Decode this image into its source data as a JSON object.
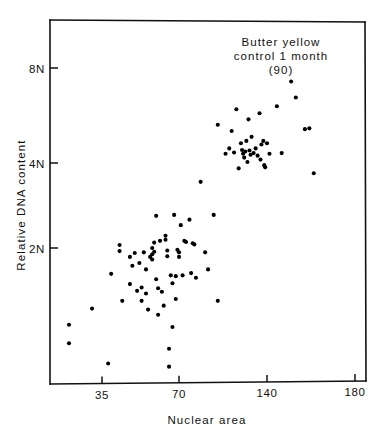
{
  "figure": {
    "background_color": "#ffffff",
    "ink_color": "#111111",
    "marker_color": "#000000"
  },
  "annotation": {
    "line1": "Butter yellow",
    "line2": "control 1 month",
    "line3": "(90)"
  },
  "chart_data": {
    "type": "scatter",
    "title": "Butter yellow control 1 month (90)",
    "xlabel": "Nuclear area",
    "ylabel": "Relative DNA content",
    "grid": false,
    "legend": false,
    "n_points_stated": 90,
    "x_ticks": [
      35,
      70,
      140,
      180
    ],
    "x_tick_labels": [
      "35",
      "70",
      "140",
      "180"
    ],
    "y_ticks": [
      2,
      4,
      8
    ],
    "y_tick_labels": [
      "2N",
      "4N",
      "8N"
    ],
    "x_scale": "log-like (35,70,140 equally spaced doublings)",
    "y_scale": "log2 (2N,4N,8N equally spaced doublings)",
    "xlim": [
      22,
      196
    ],
    "ylim": [
      0.62,
      11.4
    ],
    "series": [
      {
        "name": "nuclei",
        "marker": "filled-circle",
        "points": [
          [
            26,
            1.07
          ],
          [
            26,
            0.92
          ],
          [
            32,
            1.22
          ],
          [
            37,
            0.78
          ],
          [
            38,
            1.62
          ],
          [
            41,
            2.05
          ],
          [
            41,
            1.95
          ],
          [
            42,
            1.3
          ],
          [
            45,
            1.86
          ],
          [
            45,
            1.49
          ],
          [
            46,
            1.73
          ],
          [
            47,
            1.92
          ],
          [
            48,
            1.41
          ],
          [
            49,
            1.77
          ],
          [
            50,
            1.45
          ],
          [
            50,
            1.3
          ],
          [
            51,
            1.93
          ],
          [
            52,
            1.68
          ],
          [
            52,
            1.38
          ],
          [
            53,
            1.21
          ],
          [
            54,
            1.86
          ],
          [
            55,
            2.0
          ],
          [
            55,
            1.9
          ],
          [
            55,
            1.82
          ],
          [
            56,
            2.09
          ],
          [
            56,
            1.94
          ],
          [
            57,
            2.6
          ],
          [
            57,
            1.55
          ],
          [
            58,
            1.44
          ],
          [
            58,
            1.16
          ],
          [
            59,
            2.12
          ],
          [
            60,
            1.4
          ],
          [
            61,
            1.25
          ],
          [
            62,
            2.21
          ],
          [
            62,
            2.14
          ],
          [
            63,
            1.96
          ],
          [
            63,
            1.87
          ],
          [
            64,
            0.88
          ],
          [
            64,
            0.76
          ],
          [
            65,
            1.6
          ],
          [
            66,
            1.5
          ],
          [
            66,
            1.05
          ],
          [
            67,
            2.62
          ],
          [
            68,
            1.59
          ],
          [
            68,
            1.32
          ],
          [
            69,
            1.97
          ],
          [
            70,
            1.93
          ],
          [
            70,
            1.86
          ],
          [
            71,
            2.41
          ],
          [
            72,
            1.6
          ],
          [
            73,
            2.12
          ],
          [
            74,
            2.1
          ],
          [
            76,
            2.52
          ],
          [
            77,
            1.63
          ],
          [
            78,
            2.08
          ],
          [
            79,
            2.06
          ],
          [
            80,
            1.57
          ],
          [
            83,
            3.43
          ],
          [
            86,
            1.93
          ],
          [
            88,
            1.68
          ],
          [
            92,
            2.62
          ],
          [
            95,
            1.3
          ],
          [
            95,
            5.29
          ],
          [
            101,
            4.28
          ],
          [
            104,
            4.45
          ],
          [
            106,
            5.05
          ],
          [
            108,
            4.32
          ],
          [
            110,
            5.92
          ],
          [
            112,
            3.83
          ],
          [
            114,
            4.62
          ],
          [
            115,
            4.4
          ],
          [
            116,
            4.28
          ],
          [
            117,
            4.16
          ],
          [
            118,
            4.35
          ],
          [
            119,
            4.7
          ],
          [
            120,
            4.03
          ],
          [
            121,
            5.5
          ],
          [
            122,
            4.38
          ],
          [
            123,
            4.25
          ],
          [
            124,
            4.84
          ],
          [
            126,
            4.3
          ],
          [
            128,
            4.45
          ],
          [
            130,
            4.22
          ],
          [
            132,
            5.75
          ],
          [
            133,
            4.1
          ],
          [
            134,
            4.58
          ],
          [
            136,
            4.7
          ],
          [
            137,
            3.93
          ],
          [
            138,
            3.86
          ],
          [
            140,
            4.62
          ],
          [
            141,
            4.28
          ],
          [
            144,
            6.05
          ],
          [
            146,
            4.3
          ],
          [
            150,
            7.25
          ],
          [
            152,
            6.45
          ],
          [
            156,
            5.12
          ],
          [
            158,
            5.15
          ],
          [
            160,
            3.68
          ]
        ]
      }
    ]
  }
}
